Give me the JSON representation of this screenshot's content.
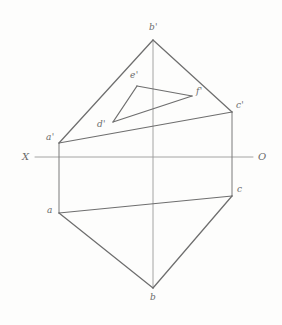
{
  "figure": {
    "type": "descriptive-geometry-projection",
    "canvas": {
      "width": 282,
      "height": 325,
      "background": "#fdfdfc"
    },
    "stroke": {
      "solid_color": "#6e6e6e",
      "axis_color": "#9a9a9a",
      "width": 1.1,
      "axis_width": 0.9
    }
  },
  "axes": {
    "ground_line": {
      "name": "XO",
      "left_label": "X",
      "right_label": "O",
      "y": 157,
      "x_start": 35,
      "x_end": 253,
      "left_label_pos": {
        "x": 22,
        "y": 151
      },
      "right_label_pos": {
        "x": 258,
        "y": 151
      }
    },
    "vertical_axis": {
      "x": 153,
      "y_start": 40,
      "y_end": 288
    }
  },
  "points": {
    "a_prime": {
      "label": "a'",
      "x": 59,
      "y": 143,
      "label_pos": {
        "x": 46,
        "y": 132
      }
    },
    "b_prime": {
      "label": "b'",
      "x": 153,
      "y": 40,
      "label_pos": {
        "x": 149,
        "y": 22
      }
    },
    "c_prime": {
      "label": "c'",
      "x": 232,
      "y": 112,
      "label_pos": {
        "x": 236,
        "y": 100
      }
    },
    "d_prime": {
      "label": "d'",
      "x": 113,
      "y": 122,
      "label_pos": {
        "x": 97,
        "y": 119
      }
    },
    "e_prime": {
      "label": "e'",
      "x": 137,
      "y": 86,
      "label_pos": {
        "x": 130,
        "y": 70
      }
    },
    "f_prime": {
      "label": "f'",
      "x": 192,
      "y": 96,
      "label_pos": {
        "x": 196,
        "y": 86
      }
    },
    "a": {
      "label": "a",
      "x": 59,
      "y": 213,
      "label_pos": {
        "x": 47,
        "y": 205
      }
    },
    "b": {
      "label": "b",
      "x": 153,
      "y": 288,
      "label_pos": {
        "x": 150,
        "y": 292
      }
    },
    "c": {
      "label": "c",
      "x": 232,
      "y": 196,
      "label_pos": {
        "x": 237,
        "y": 184
      }
    }
  },
  "edges": {
    "front_view_triangle": [
      {
        "name": "a'b'",
        "from": "a_prime",
        "to": "b_prime"
      },
      {
        "name": "b'c'",
        "from": "b_prime",
        "to": "c_prime"
      },
      {
        "name": "c'a'",
        "from": "c_prime",
        "to": "a_prime"
      }
    ],
    "front_view_inner_triangle": [
      {
        "name": "d'e'",
        "from": "d_prime",
        "to": "e_prime"
      },
      {
        "name": "e'f'",
        "from": "e_prime",
        "to": "f_prime"
      },
      {
        "name": "f'd'",
        "from": "f_prime",
        "to": "d_prime"
      }
    ],
    "top_view_triangle": [
      {
        "name": "ab",
        "from": "a",
        "to": "b"
      },
      {
        "name": "bc",
        "from": "b",
        "to": "c"
      },
      {
        "name": "ca",
        "from": "c",
        "to": "a"
      }
    ],
    "projection_connectors": [
      {
        "name": "aa'",
        "from": "a_prime",
        "to": "a"
      },
      {
        "name": "cc'",
        "from": "c_prime",
        "to": "c"
      }
    ]
  }
}
